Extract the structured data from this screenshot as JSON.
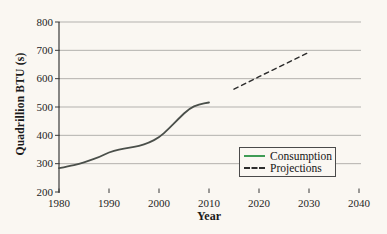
{
  "figure": {
    "background": "#faf7f2",
    "xlabel": "Year",
    "ylabel": "Quadrillion BTU (s)"
  },
  "legend": {
    "position": "lower right",
    "entries": [
      {
        "label": "Consumption",
        "style": "solid",
        "color": "#3f9c55"
      },
      {
        "label": "Projections",
        "style": "dashed",
        "color": "#2d2d2d"
      }
    ]
  },
  "chart_data": {
    "type": "line",
    "title": "",
    "xlabel": "Year",
    "ylabel": "Quadrillion BTU (s)",
    "xlim": [
      1980,
      2040
    ],
    "ylim": [
      200,
      800
    ],
    "x_ticks": [
      1980,
      1990,
      2000,
      2010,
      2020,
      2030,
      2040
    ],
    "y_ticks": [
      200,
      300,
      400,
      500,
      600,
      700,
      800
    ],
    "grid": "horizontal",
    "gridline_color": "#b3b1ae",
    "axis_color": "#3a3a3a",
    "axis_x_gradient_colors": [
      "#8f8030",
      "#5c54c6",
      "#42a44f"
    ],
    "legend_position": "lower right",
    "series": [
      {
        "name": "Consumption",
        "line_style": "solid",
        "color": "#4a4f4a",
        "points": [
          [
            1980,
            284
          ],
          [
            1982,
            291
          ],
          [
            1984,
            299
          ],
          [
            1986,
            311
          ],
          [
            1988,
            323
          ],
          [
            1990,
            340
          ],
          [
            1992,
            350
          ],
          [
            1994,
            356
          ],
          [
            1996,
            362
          ],
          [
            1998,
            374
          ],
          [
            2000,
            392
          ],
          [
            2002,
            424
          ],
          [
            2004,
            460
          ],
          [
            2006,
            494
          ],
          [
            2008,
            510
          ],
          [
            2010,
            516
          ]
        ]
      },
      {
        "name": "Projections",
        "line_style": "dashed",
        "color": "#2d2d2d",
        "points": [
          [
            2015,
            563
          ],
          [
            2020,
            607
          ],
          [
            2025,
            650
          ],
          [
            2030,
            693
          ]
        ]
      }
    ]
  }
}
